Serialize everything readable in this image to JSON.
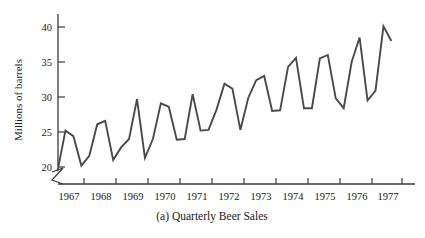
{
  "chart_data": {
    "type": "line",
    "title": "",
    "caption": "(a) Quarterly Beer Sales",
    "xlabel": "",
    "ylabel": "Millions of barrels",
    "ylim": [
      18.5,
      41.5
    ],
    "yticks": [
      20,
      25,
      30,
      35,
      40
    ],
    "ytick_labels": [
      "20",
      "25",
      "30",
      "35",
      "40"
    ],
    "y_axis_break": true,
    "grid": false,
    "legend": null,
    "xtick_labels": [
      "1967",
      "1968",
      "1969",
      "1970",
      "1971",
      "1972",
      "1973",
      "1974",
      "1975",
      "1976",
      "1977"
    ],
    "x_unit": "quarter",
    "line_color": "#4a4a4a",
    "axis_color": "#3a3a3a",
    "x": [
      "1967 Q1",
      "1967 Q2",
      "1967 Q3",
      "1967 Q4",
      "1968 Q1",
      "1968 Q2",
      "1968 Q3",
      "1968 Q4",
      "1969 Q1",
      "1969 Q2",
      "1969 Q3",
      "1969 Q4",
      "1970 Q1",
      "1970 Q2",
      "1970 Q3",
      "1970 Q4",
      "1971 Q1",
      "1971 Q2",
      "1971 Q3",
      "1971 Q4",
      "1972 Q1",
      "1972 Q2",
      "1972 Q3",
      "1972 Q4",
      "1973 Q1",
      "1973 Q2",
      "1973 Q3",
      "1973 Q4",
      "1974 Q1",
      "1974 Q2",
      "1974 Q3",
      "1974 Q4",
      "1975 Q1",
      "1975 Q2",
      "1975 Q3",
      "1975 Q4",
      "1976 Q1",
      "1976 Q2",
      "1976 Q3",
      "1976 Q4",
      "1977 Q1",
      "1977 Q2",
      "1977 Q3"
    ],
    "values": [
      19.4,
      25.2,
      24.4,
      20.2,
      21.6,
      26.1,
      26.6,
      21.0,
      22.8,
      24.0,
      29.7,
      21.3,
      24.0,
      29.1,
      28.6,
      23.9,
      24.0,
      30.4,
      25.2,
      25.3,
      28.2,
      31.9,
      31.2,
      25.3,
      29.9,
      32.4,
      33.0,
      28.0,
      28.1,
      34.3,
      35.6,
      28.4,
      28.4,
      35.5,
      36.0,
      29.8,
      28.4,
      35.0,
      38.5,
      29.5,
      30.9,
      40.1,
      38.0
    ]
  }
}
